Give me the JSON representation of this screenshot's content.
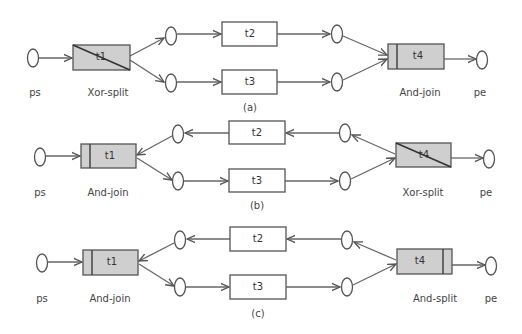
{
  "figure": {
    "panels": [
      {
        "id": "a",
        "caption": "(a)",
        "start_place": "ps",
        "end_place": "pe",
        "t1": {
          "label": "t1",
          "type": "Xor-split"
        },
        "t2": {
          "label": "t2"
        },
        "t3": {
          "label": "t3"
        },
        "t4": {
          "label": "t4",
          "type": "And-join"
        }
      },
      {
        "id": "b",
        "caption": "(b)",
        "start_place": "ps",
        "end_place": "pe",
        "t1": {
          "label": "t1",
          "type": "And-join"
        },
        "t2": {
          "label": "t2"
        },
        "t3": {
          "label": "t3"
        },
        "t4": {
          "label": "t4",
          "type": "Xor-split"
        }
      },
      {
        "id": "c",
        "caption": "(c)",
        "start_place": "ps",
        "end_place": "pe",
        "t1": {
          "label": "t1",
          "type": "And-join"
        },
        "t2": {
          "label": "t2"
        },
        "t3": {
          "label": "t3"
        },
        "t4": {
          "label": "t4",
          "type": "And-split"
        }
      }
    ]
  },
  "colors": {
    "stroke": "#555555",
    "gray_fill": "#cfcfcf",
    "background": "#ffffff"
  }
}
